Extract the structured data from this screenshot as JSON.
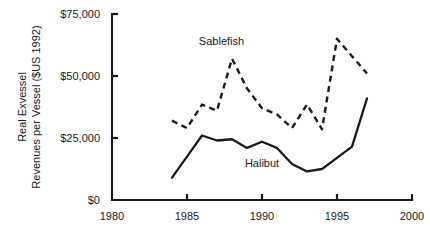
{
  "chart_data": {
    "type": "line",
    "title": "",
    "xlabel": "",
    "ylabel": "Real Exvessel Revenues per Vessel ($US 1992)",
    "ylabel_line1": "Real Exvessel",
    "ylabel_line2": "Revenues per Vessel ($US 1992)",
    "xlim": [
      1980,
      2000
    ],
    "ylim": [
      0,
      75000
    ],
    "grid": false,
    "legend_position": "inline-annotations",
    "x_ticks": [
      1980,
      1985,
      1990,
      1995,
      2000
    ],
    "x_tick_labels": [
      "1980",
      "1985",
      "1990",
      "1995",
      "2000"
    ],
    "y_ticks": [
      0,
      25000,
      50000,
      75000
    ],
    "y_tick_labels": [
      "$0",
      "$25,000",
      "$50,000",
      "$75,000"
    ],
    "series": [
      {
        "name": "Sablefish",
        "style": "dashed",
        "color": "#1a1a1a",
        "x": [
          1984,
          1985,
          1986,
          1987,
          1988,
          1989,
          1990,
          1991,
          1992,
          1993,
          1994,
          1995,
          1996,
          1997
        ],
        "values": [
          32000,
          29000,
          38500,
          36000,
          57000,
          45000,
          37000,
          34500,
          29000,
          38500,
          28500,
          65000,
          58000,
          51000
        ]
      },
      {
        "name": "Halibut",
        "style": "solid",
        "color": "#1a1a1a",
        "x": [
          1984,
          1985,
          1986,
          1987,
          1988,
          1989,
          1990,
          1991,
          1992,
          1993,
          1994,
          1995,
          1996,
          1997
        ],
        "values": [
          9000,
          17500,
          26000,
          24000,
          24500,
          21000,
          23500,
          21000,
          14500,
          11500,
          12500,
          17000,
          21500,
          41000
        ]
      }
    ],
    "annotations": [
      {
        "text": "Sablefish",
        "x": 1987.3,
        "y": 62500
      },
      {
        "text": "Halibut",
        "x": 1990.0,
        "y": 13500
      }
    ]
  }
}
